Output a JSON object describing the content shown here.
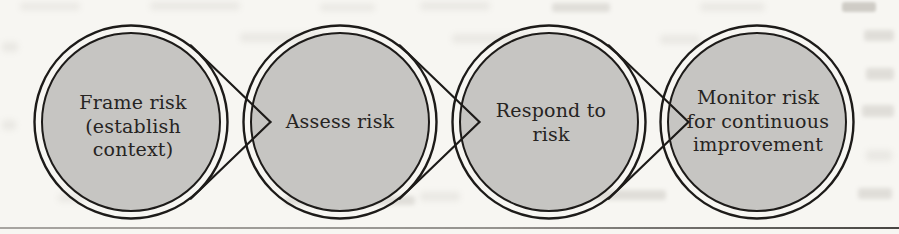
{
  "figure": {
    "type": "process-flow-diagram",
    "stages": [
      {
        "name": "frame-risk",
        "lines": [
          "Frame risk",
          "(establish",
          "context)"
        ]
      },
      {
        "name": "assess-risk",
        "lines": [
          "Assess risk"
        ]
      },
      {
        "name": "respond-risk",
        "lines": [
          "Respond to",
          "risk"
        ]
      },
      {
        "name": "monitor-risk",
        "lines": [
          "Monitor risk",
          "for continuous",
          "improvement"
        ]
      }
    ],
    "colors": {
      "page_bg": "#f7f6f2",
      "circle_fill": "#c6c5c2",
      "stroke": "#1d1b19",
      "text": "#262422",
      "rule": "#4a4845"
    }
  }
}
